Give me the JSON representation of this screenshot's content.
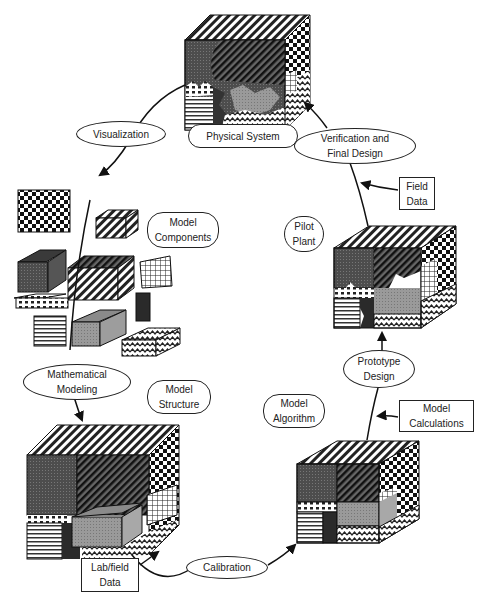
{
  "diagram": {
    "type": "cyclic process diagram",
    "cycle_stages": [
      {
        "id": "physical",
        "label": "Physical System"
      },
      {
        "id": "components",
        "label": "Model Components"
      },
      {
        "id": "structure",
        "label": "Model Structure"
      },
      {
        "id": "algorithm",
        "label": "Model Algorithm"
      },
      {
        "id": "pilot",
        "label": "Pilot Plant"
      }
    ],
    "transitions": [
      {
        "label_l1": "Visualization",
        "label_l2": "",
        "from": "physical",
        "to": "components"
      },
      {
        "label_l1": "Mathematical",
        "label_l2": "Modeling",
        "from": "components",
        "to": "structure"
      },
      {
        "label_l1": "Calibration",
        "label_l2": "",
        "from": "structure",
        "to": "algorithm"
      },
      {
        "label_l1": "Prototype",
        "label_l2": "Design",
        "from": "algorithm",
        "to": "pilot"
      },
      {
        "label_l1": "Verification and",
        "label_l2": "Final Design",
        "from": "pilot",
        "to": "physical"
      }
    ],
    "inputs": [
      {
        "label_l1": "Lab/field",
        "label_l2": "Data",
        "feeds": "Calibration"
      },
      {
        "label_l1": "Model",
        "label_l2": "Calculations",
        "feeds": "Prototype Design"
      },
      {
        "label_l1": "Field",
        "label_l2": "Data",
        "feeds": "Verification and Final Design"
      }
    ],
    "stage_labels": {
      "physical": "Physical System",
      "components_l1": "Model",
      "components_l2": "Components",
      "structure_l1": "Model",
      "structure_l2": "Structure",
      "algorithm_l1": "Model",
      "algorithm_l2": "Algorithm",
      "pilot_l1": "Pilot",
      "pilot_l2": "Plant"
    },
    "colors": {
      "line": "#1a1a1a",
      "dark_gray": "#4a4a4a",
      "mid_gray": "#8c8c8c",
      "light_gray": "#b8b8b8",
      "background": "#ffffff"
    }
  }
}
